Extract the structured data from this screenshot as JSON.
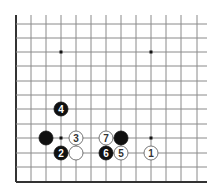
{
  "diagram": {
    "type": "go-board-corner",
    "corner": "lower-left",
    "grid": {
      "x_lines": [
        16,
        31,
        46,
        61,
        76,
        91,
        106,
        121,
        136,
        151,
        166,
        181,
        197
      ],
      "y_lines": [
        24,
        38,
        52,
        66,
        81,
        95,
        109,
        124,
        138,
        153,
        167,
        182
      ],
      "line_color": "#8a8a8a",
      "edge_color": "#333333",
      "extend_top": 15,
      "extend_right": 207
    },
    "star_points": [
      {
        "col": 3,
        "row": 2
      },
      {
        "col": 9,
        "row": 2
      },
      {
        "col": 3,
        "row": 8
      },
      {
        "col": 9,
        "row": 8
      }
    ],
    "stones": [
      {
        "color": "black",
        "col": 2,
        "row": 8,
        "label": ""
      },
      {
        "color": "black",
        "col": 7,
        "row": 8,
        "label": ""
      },
      {
        "color": "white",
        "col": 4,
        "row": 9,
        "label": ""
      },
      {
        "color": "white",
        "col": 9,
        "row": 9,
        "label": "1"
      },
      {
        "color": "black",
        "col": 3,
        "row": 9,
        "label": "2"
      },
      {
        "color": "white",
        "col": 4,
        "row": 8,
        "label": "3"
      },
      {
        "color": "black",
        "col": 3,
        "row": 6,
        "label": "4"
      },
      {
        "color": "white",
        "col": 7,
        "row": 9,
        "label": "5"
      },
      {
        "color": "black",
        "col": 6,
        "row": 9,
        "label": "6"
      },
      {
        "color": "white",
        "col": 6,
        "row": 8,
        "label": "7"
      }
    ]
  }
}
